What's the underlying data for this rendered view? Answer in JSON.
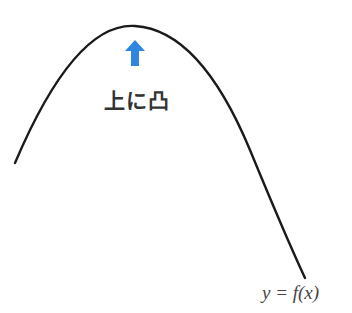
{
  "diagram": {
    "concavity_label": "上に凸",
    "equation": "y = f(x)",
    "arrow": {
      "direction": "up",
      "color": "#2e86de"
    },
    "curve": {
      "shape": "concave-down parabola",
      "color": "#1a1a1a",
      "start": [
        15,
        163
      ],
      "peak": [
        135,
        25
      ],
      "end": [
        305,
        278
      ]
    }
  }
}
